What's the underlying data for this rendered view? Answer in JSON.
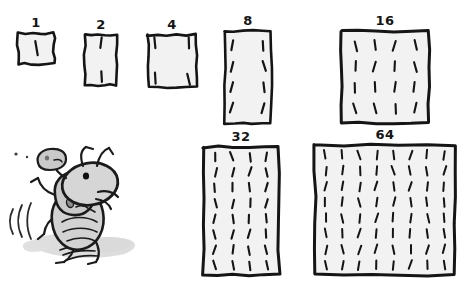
{
  "illustration": {
    "title": "Doubling tally boxes with running ant",
    "style": "hand-drawn sketch",
    "background_color": "#ffffff",
    "ink_color": "#151515",
    "box_fill_color": "#f2f2f2",
    "shadow_color": "#b9b9b9",
    "ant_body_color": "#cccccc"
  },
  "boxes": [
    {
      "id": "box-1",
      "label": "1",
      "tally_count": 1,
      "columns": 1,
      "rows": 1,
      "label_position": "above",
      "x": 18,
      "y": 33,
      "width": 36,
      "height": 31
    },
    {
      "id": "box-2",
      "label": "2",
      "tally_count": 2,
      "columns": 1,
      "rows": 2,
      "label_position": "above",
      "x": 85,
      "y": 35,
      "width": 32,
      "height": 50
    },
    {
      "id": "box-4",
      "label": "4",
      "tally_count": 4,
      "columns": 2,
      "rows": 2,
      "label_position": "above",
      "x": 148,
      "y": 35,
      "width": 48,
      "height": 52
    },
    {
      "id": "box-8",
      "label": "8",
      "tally_count": 8,
      "columns": 2,
      "rows": 4,
      "label_position": "above",
      "x": 225,
      "y": 31,
      "width": 46,
      "height": 92
    },
    {
      "id": "box-16",
      "label": "16",
      "tally_count": 16,
      "columns": 4,
      "rows": 4,
      "label_position": "above",
      "x": 341,
      "y": 31,
      "width": 88,
      "height": 92
    },
    {
      "id": "box-32",
      "label": "32",
      "tally_count": 32,
      "columns": 4,
      "rows": 8,
      "label_position": "above",
      "x": 203,
      "y": 147,
      "width": 76,
      "height": 128
    },
    {
      "id": "box-64",
      "label": "64",
      "tally_count": 64,
      "columns": 8,
      "rows": 8,
      "label_position": "above",
      "x": 315,
      "y": 145,
      "width": 140,
      "height": 130
    }
  ],
  "ant": {
    "name": "running-ant",
    "description": "cartoon ant running to the right with motion lines and shadow",
    "motion_lines": 3,
    "has_shadow": true,
    "x": 10,
    "y": 150,
    "width": 130,
    "height": 120
  },
  "sequence": {
    "name": "doubling-sequence",
    "values": [
      1,
      2,
      4,
      8,
      16,
      32,
      64
    ]
  }
}
